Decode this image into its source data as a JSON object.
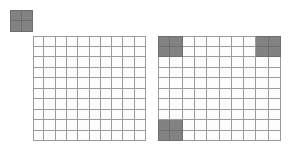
{
  "page": {
    "background_color": "#ffffff",
    "width": 291,
    "height": 154
  },
  "colors": {
    "filled_cell": "#828282",
    "empty_cell": "#fdfdfd",
    "grid_line": "#9b9b9b",
    "filled_grid_line": "#6e6e6e"
  },
  "legend_key": {
    "name": "unit-square-key",
    "rows": 2,
    "columns": 2,
    "all_filled": true,
    "filled_cells": [
      [
        0,
        0
      ],
      [
        0,
        1
      ],
      [
        1,
        0
      ],
      [
        1,
        1
      ]
    ]
  },
  "grids": [
    {
      "name": "left-grid",
      "rows": 10,
      "columns": 10,
      "filled_cells": [],
      "filled_count": 0,
      "total_cells": 100
    },
    {
      "name": "right-grid",
      "rows": 10,
      "columns": 10,
      "filled_cells": [
        [
          0,
          0
        ],
        [
          0,
          1
        ],
        [
          1,
          0
        ],
        [
          1,
          1
        ],
        [
          0,
          8
        ],
        [
          0,
          9
        ],
        [
          1,
          8
        ],
        [
          1,
          9
        ],
        [
          8,
          0
        ],
        [
          8,
          1
        ],
        [
          9,
          0
        ],
        [
          9,
          1
        ]
      ],
      "filled_count": 12,
      "total_cells": 100
    }
  ],
  "chart_data": {
    "type": "heatmap",
    "title": "",
    "xlabel": "",
    "ylabel": "",
    "grid": true,
    "legend_position": "top-left",
    "categories": [
      "left-grid",
      "right-grid"
    ],
    "series": [
      {
        "name": "left-grid",
        "values": 0
      },
      {
        "name": "right-grid",
        "values": 12
      }
    ],
    "annotations": []
  }
}
